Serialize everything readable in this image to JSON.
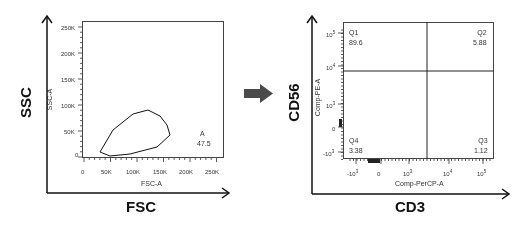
{
  "figure": {
    "arrow": {
      "direction": "right",
      "color": "#4a4a4a"
    }
  },
  "chart_data": [
    {
      "type": "scatter",
      "title": "",
      "outer_xlabel": "FSC",
      "outer_ylabel": "SSC",
      "xlabel": "FSC-A",
      "ylabel": "SSC-A",
      "xlim": [
        0,
        262144
      ],
      "ylim": [
        0,
        262144
      ],
      "x_ticks": [
        "0",
        "50K",
        "100K",
        "150K",
        "200K",
        "250K"
      ],
      "y_ticks": [
        "0",
        "50K",
        "100K",
        "150K",
        "200K",
        "250K"
      ],
      "gate": {
        "name": "A",
        "percent": "47.5",
        "shape": "polygon",
        "vertices": [
          [
            35000,
            5000
          ],
          [
            55000,
            2000
          ],
          [
            120000,
            8000
          ],
          [
            165000,
            28000
          ],
          [
            172000,
            55000
          ],
          [
            160000,
            80000
          ],
          [
            135000,
            92000
          ],
          [
            105000,
            88000
          ],
          [
            60000,
            40000
          ]
        ]
      },
      "populations": [
        {
          "name": "debris/main cluster",
          "center": [
            60000,
            20000
          ],
          "spread": [
            30000,
            15000
          ],
          "density": "high"
        },
        {
          "name": "scattered",
          "center": [
            100000,
            70000
          ],
          "spread": [
            55000,
            55000
          ],
          "density": "low"
        }
      ],
      "grid": false,
      "legend": null
    },
    {
      "type": "scatter",
      "title": "",
      "outer_xlabel": "CD3",
      "outer_ylabel": "CD56",
      "xlabel": "Comp-PerCP-A",
      "ylabel": "Comp-PE-A",
      "x_scale": "biexponential",
      "y_scale": "biexponential",
      "x_ticks": [
        "-10^3",
        "0",
        "10^3",
        "10^4",
        "10^5"
      ],
      "y_ticks": [
        "-10^3",
        "0",
        "10^3",
        "10^4",
        "10^5"
      ],
      "quadrant_gates": {
        "x_threshold": "≈3×10^3",
        "y_threshold": "≈7×10^3"
      },
      "quadrants": [
        {
          "name": "Q1",
          "percent": "89.6",
          "position": "top-left"
        },
        {
          "name": "Q2",
          "percent": "5.88",
          "position": "top-right"
        },
        {
          "name": "Q3",
          "percent": "1.12",
          "position": "bottom-right"
        },
        {
          "name": "Q4",
          "percent": "3.38",
          "position": "bottom-left"
        }
      ],
      "grid": false,
      "legend": null
    }
  ],
  "labels": {
    "left": {
      "outer_y": "SSC",
      "outer_x": "FSC",
      "inner_y": "SSC-A",
      "inner_x": "FSC-A",
      "yticks": [
        "250K",
        "200K",
        "150K",
        "100K",
        "50K",
        "0"
      ],
      "xticks": [
        "0",
        "50K",
        "100K",
        "150K",
        "200K",
        "250K"
      ],
      "gate_name": "A",
      "gate_pct": "47.5"
    },
    "right": {
      "outer_y": "CD56",
      "outer_x": "CD3",
      "inner_y": "Comp-PE-A",
      "inner_x": "Comp-PerCP-A",
      "ytick_base": [
        "10",
        "10",
        "10",
        "0",
        "-10"
      ],
      "ytick_exp": [
        "5",
        "4",
        "3",
        "",
        "3"
      ],
      "xtick_base": [
        "-10",
        "0",
        "10",
        "10",
        "10"
      ],
      "xtick_exp": [
        "3",
        "",
        "3",
        "4",
        "5"
      ],
      "q1_name": "Q1",
      "q1_pct": "89.6",
      "q2_name": "Q2",
      "q2_pct": "5.88",
      "q3_name": "Q3",
      "q3_pct": "1.12",
      "q4_name": "Q4",
      "q4_pct": "3.38"
    }
  }
}
